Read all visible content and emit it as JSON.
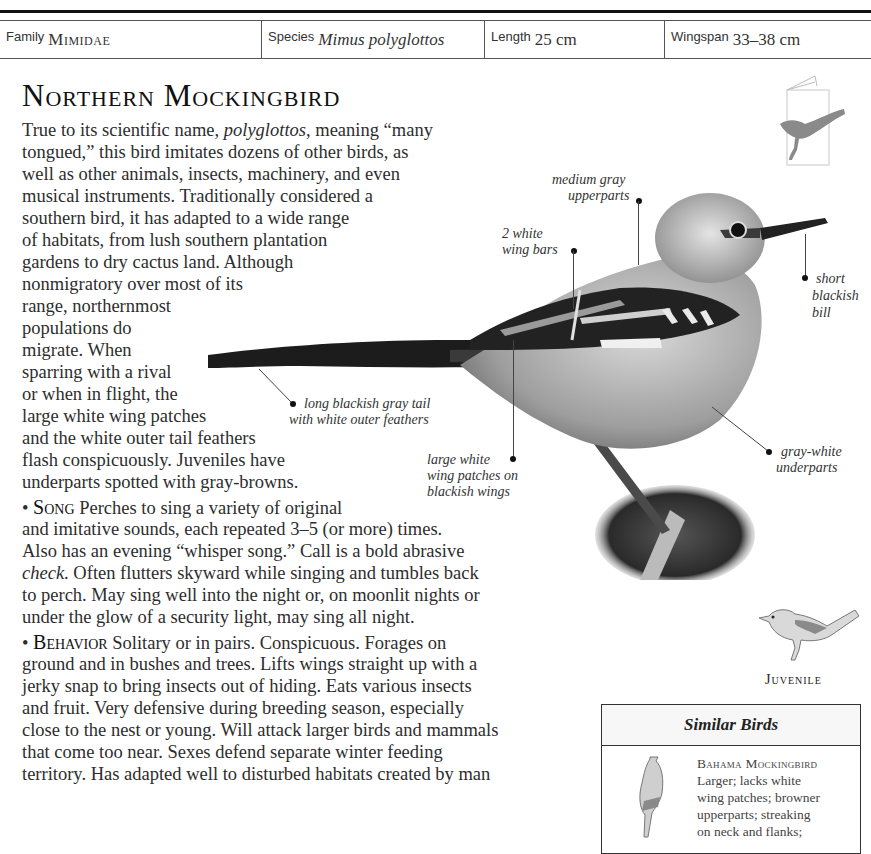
{
  "facts": {
    "family": {
      "label": "Family",
      "value": "Mimidae"
    },
    "species": {
      "label": "Species",
      "value": "Mimus polyglottos"
    },
    "length": {
      "label": "Length",
      "value": "25 cm"
    },
    "wingspan": {
      "label": "Wingspan",
      "value": "33–38 cm"
    }
  },
  "title": "Northern Mockingbird",
  "intro": {
    "lines": [
      {
        "pre": "True to its scientific name, ",
        "em": "polyglottos",
        "post": ", meaning “many"
      },
      "tongued,” this bird imitates dozens of other birds, as",
      "well as other animals, insects, machinery, and even",
      "musical instruments. Traditionally considered a",
      "southern bird, it has adapted to a wide range",
      "of habitats, from lush southern plantation",
      "gardens to dry cactus land. Although",
      "nonmigratory over most of its",
      "range, northernmost",
      "populations do",
      "migrate. When",
      "sparring with a rival",
      "or when in flight, the",
      "large white wing patches",
      "and the white outer tail feathers",
      "flash conspicuously. Juveniles have",
      "underparts spotted with gray-browns."
    ]
  },
  "song": {
    "label": "Song",
    "lines": [
      "Perches to sing a variety of original",
      "and imitative sounds, each repeated 3–5 (or more) times.",
      "Also has an evening “whisper song.” Call is a bold abrasive",
      {
        "em": "check",
        "post": ". Often flutters skyward while singing and tumbles back"
      },
      "to perch. May sing well into the night or, on moonlit nights or",
      "under the glow of a security light, may sing all night."
    ]
  },
  "behavior": {
    "label": "Behavior",
    "lines": [
      "Solitary or in pairs. Conspicuous. Forages on",
      "ground and in bushes and trees. Lifts wings straight up with a",
      "jerky snap to bring insects out of hiding. Eats various insects",
      "and fruit. Very defensive during breeding season, especially",
      "close to the nest or young. Will attack larger birds and mammals",
      "that come too near. Sexes defend separate winter feeding",
      "territory. Has adapted well to disturbed habitats created by man"
    ]
  },
  "callouts": {
    "upperparts": [
      "medium gray",
      "upperparts"
    ],
    "wing_bars": [
      "2 white",
      "wing bars"
    ],
    "bill": [
      "short",
      "blackish",
      "bill"
    ],
    "tail": [
      "long blackish gray tail",
      "with white outer feathers"
    ],
    "wing_patches": [
      "large white",
      "wing patches on",
      "blackish wings"
    ],
    "underparts": [
      "gray-white",
      "underparts"
    ]
  },
  "juvenile_label": "Juvenile",
  "similar_birds": {
    "heading": "Similar Birds",
    "items": [
      {
        "name": "Bahama Mockingbird",
        "lines": [
          "Larger; lacks white",
          "wing patches; browner",
          "upperparts; streaking",
          "on neck and flanks;"
        ]
      }
    ]
  },
  "colors": {
    "text": "#2d2d2d",
    "rule": "#111111",
    "silhouette": "#8a8a8a"
  }
}
